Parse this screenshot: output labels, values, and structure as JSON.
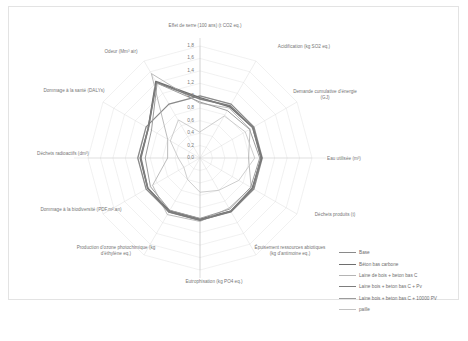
{
  "chart_data": {
    "type": "line",
    "subtype": "radar",
    "title": "",
    "grid": true,
    "legend_position": "bottom-right",
    "rlim": [
      0.0,
      1.8
    ],
    "r_ticks": [
      "0,0",
      "0,2",
      "0,4",
      "0,6",
      "0,8",
      "1,0",
      "1,2",
      "1,4",
      "1,6",
      "1,8"
    ],
    "r_tick_values": [
      0.0,
      0.2,
      0.4,
      0.6,
      0.8,
      1.0,
      1.2,
      1.4,
      1.6,
      1.8
    ],
    "categories": [
      "Effet de serre (100 ans) (t CO2 eq.)",
      "Acidification (kg SO2 eq.)",
      "Demande cumulative d'énergie (GJ)",
      "Eau utilisée (m³)",
      "Déchets produits (t)",
      "Épuisement ressources abiotiques (kg d'antimoine eq.)",
      "Eutrophisation (kg PO4 eq.)",
      "Production d'ozone photochimique (kg d'éthylène eq.)",
      "Dommage à la biodiversité (PDF.m².an)",
      "Déchets radioactifs (dm³)",
      "Dommage à la santé (DALYs)",
      "Odeur (Mm³ air)"
    ],
    "series": [
      {
        "name": "Base",
        "color": "#8a8a8a",
        "width": 1.3,
        "values": [
          1.0,
          1.0,
          1.0,
          1.0,
          1.0,
          1.0,
          1.0,
          1.0,
          1.0,
          1.0,
          1.0,
          1.0
        ]
      },
      {
        "name": "Béton bas carbone",
        "color": "#6e6e6e",
        "width": 1.5,
        "values": [
          0.97,
          0.95,
          0.98,
          0.99,
          0.97,
          0.99,
          0.98,
          0.98,
          0.97,
          0.96,
          0.96,
          1.42
        ]
      },
      {
        "name": "Laine de bois + beton bas C",
        "color": "#b4b4b4",
        "width": 0.9,
        "values": [
          0.88,
          0.93,
          0.93,
          0.78,
          0.95,
          0.93,
          1.02,
          1.05,
          0.88,
          0.52,
          0.6,
          1.56
        ]
      },
      {
        "name": "Laine bois + beton bas C + Pv",
        "color": "#7d7d7d",
        "width": 1.6,
        "values": [
          0.95,
          0.97,
          0.98,
          0.98,
          0.98,
          0.99,
          1.0,
          1.0,
          0.97,
          0.95,
          0.96,
          1.4
        ]
      },
      {
        "name": "Laine bois + beton bas C + 10000 PV",
        "color": "#9c9c9c",
        "width": 1.0,
        "values": [
          0.9,
          0.88,
          0.92,
          0.96,
          0.94,
          0.95,
          0.97,
          0.97,
          0.92,
          0.88,
          0.9,
          1.38
        ]
      },
      {
        "name": "paille",
        "color": "#c2c2c2",
        "width": 0.8,
        "values": [
          0.42,
          0.78,
          0.84,
          0.88,
          0.72,
          0.6,
          0.55,
          0.4,
          0.3,
          0.35,
          0.55,
          0.7
        ]
      }
    ]
  },
  "axis_labels": [
    {
      "text": "Effet de serre (100 ans) (t CO2 eq.)",
      "name": "axis-label-effet-de-serre"
    },
    {
      "text": "Acidification (kg SO2 eq.)",
      "name": "axis-label-acidification"
    },
    {
      "text": "Demande cumulative d'énergie (GJ)",
      "name": "axis-label-demande-energie"
    },
    {
      "text": "Eau utilisée (m³)",
      "name": "axis-label-eau-utilisee"
    },
    {
      "text": "Déchets produits (t)",
      "name": "axis-label-dechets-produits"
    },
    {
      "text": "Épuisement ressources abiotiques (kg d'antimoine eq.)",
      "name": "axis-label-epuisement-ressources"
    },
    {
      "text": "Eutrophisation (kg PO4 eq.)",
      "name": "axis-label-eutrophisation"
    },
    {
      "text": "Production d'ozone photochimique (kg d'éthylène eq.)",
      "name": "axis-label-ozone-photochimique"
    },
    {
      "text": "Dommage à la biodiversité (PDF.m².an)",
      "name": "axis-label-biodiversite"
    },
    {
      "text": "Déchets radioactifs (dm³)",
      "name": "axis-label-dechets-radioactifs"
    },
    {
      "text": "Dommage à la santé (DALYs)",
      "name": "axis-label-dommage-sante"
    },
    {
      "text": "Odeur (Mm³ air)",
      "name": "axis-label-odeur"
    }
  ]
}
